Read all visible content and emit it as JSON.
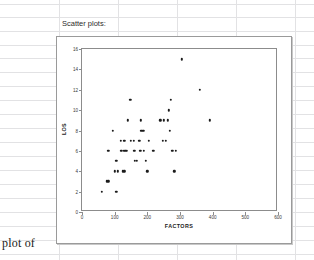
{
  "document": {
    "body_text": "plot of"
  },
  "spreadsheet": {
    "caption_cell": "Scatter plots:",
    "grid_color": "#e2e2e4",
    "row_lines_y": [
      4,
      17,
      31,
      45,
      58,
      72,
      86,
      100,
      114,
      128,
      142,
      156,
      170,
      184,
      198,
      212,
      226,
      240,
      254
    ],
    "col_lines_x": [
      59,
      118,
      177,
      236,
      295
    ]
  },
  "chart_data": {
    "type": "scatter",
    "title": "",
    "xlabel": "FACTORS",
    "ylabel": "LOS",
    "xlim": [
      0,
      600
    ],
    "ylim": [
      0,
      16
    ],
    "xticks": [
      0,
      100,
      200,
      300,
      400,
      500,
      600
    ],
    "yticks": [
      0,
      2,
      4,
      6,
      8,
      10,
      12,
      14,
      16
    ],
    "grid": false,
    "legend": "none",
    "marker_color": "#1b1b1b",
    "points": [
      [
        60,
        2
      ],
      [
        75,
        3
      ],
      [
        80,
        3
      ],
      [
        105,
        2
      ],
      [
        80,
        6
      ],
      [
        95,
        8
      ],
      [
        100,
        4
      ],
      [
        110,
        4
      ],
      [
        105,
        5
      ],
      [
        118,
        7
      ],
      [
        130,
        7
      ],
      [
        120,
        6
      ],
      [
        128,
        6
      ],
      [
        133,
        6
      ],
      [
        137,
        6
      ],
      [
        124,
        4
      ],
      [
        130,
        4
      ],
      [
        140,
        9
      ],
      [
        148,
        11
      ],
      [
        150,
        7
      ],
      [
        158,
        7
      ],
      [
        160,
        6
      ],
      [
        162,
        5
      ],
      [
        168,
        5
      ],
      [
        175,
        7
      ],
      [
        180,
        9
      ],
      [
        182,
        8
      ],
      [
        188,
        8
      ],
      [
        178,
        6
      ],
      [
        190,
        6
      ],
      [
        196,
        5
      ],
      [
        200,
        4
      ],
      [
        205,
        7
      ],
      [
        218,
        6
      ],
      [
        240,
        9
      ],
      [
        250,
        9
      ],
      [
        248,
        7
      ],
      [
        256,
        7
      ],
      [
        262,
        9
      ],
      [
        265,
        10
      ],
      [
        268,
        8
      ],
      [
        272,
        11
      ],
      [
        276,
        6
      ],
      [
        288,
        6
      ],
      [
        282,
        4
      ],
      [
        305,
        15
      ],
      [
        360,
        12
      ],
      [
        392,
        9
      ]
    ]
  }
}
